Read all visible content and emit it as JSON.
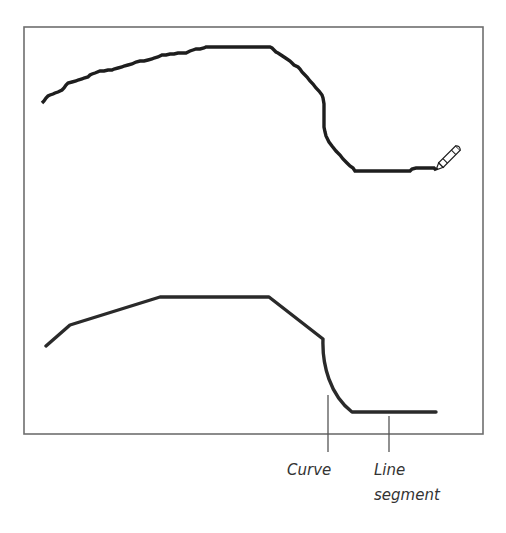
{
  "diagram": {
    "colors": {
      "frame": "#6e6e6e",
      "stroke": "#1e1e1e",
      "smooth_stroke": "#2a2a2a",
      "label_text": "#333333",
      "callout_line": "#555555"
    },
    "freehand_path": {
      "name": "freehand-stroke",
      "tool_icon": "pencil-icon"
    },
    "smoothed_path": {
      "name": "smoothed-stroke"
    },
    "callouts": [
      {
        "id": "curve",
        "label": "Curve"
      },
      {
        "id": "line",
        "label_line1": "Line",
        "label_line2": "segment"
      }
    ]
  }
}
